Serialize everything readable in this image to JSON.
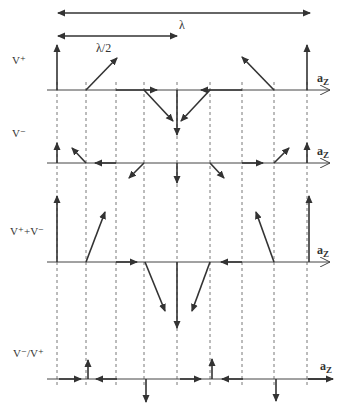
{
  "diagram": {
    "wavelength_label": "λ",
    "half_wavelength_label": "λ/2",
    "axis_label": "a",
    "axis_subscript": "Z",
    "colors": {
      "stroke": "#333333",
      "dashed": "#555555",
      "background": "#ffffff"
    },
    "panels": [
      {
        "label": "V⁺",
        "description": "incident wave phasors"
      },
      {
        "label": "V⁻",
        "description": "reflected wave phasors"
      },
      {
        "label": "V⁺+V⁻",
        "description": "total voltage phasors"
      },
      {
        "label": "V⁻/V⁺",
        "description": "reflection coefficient phasors"
      }
    ]
  }
}
